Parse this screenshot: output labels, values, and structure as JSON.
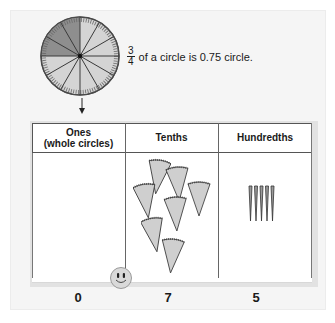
{
  "diagram": {
    "circle": {
      "total_segments": 12,
      "shaded_fraction": "1/4 (dark)",
      "light_fraction": "3/4",
      "colors": {
        "light": "#cfcfcf",
        "dark": "#8a8a8a",
        "rim": "#555555"
      }
    },
    "caption": {
      "numerator": "3",
      "denominator": "4",
      "text": "of a circle is 0.75 circle."
    },
    "table": {
      "headers": [
        {
          "line1": "Ones",
          "line2": "(whole circles)"
        },
        {
          "line1": "Tenths",
          "line2": ""
        },
        {
          "line1": "Hundredths",
          "line2": ""
        }
      ],
      "contents": {
        "ones_count": 0,
        "tenths_wedges": 7,
        "hundredths_slivers": 5
      },
      "values": [
        "0",
        "7",
        "5"
      ]
    },
    "decimal_marker": "smiley-face"
  }
}
